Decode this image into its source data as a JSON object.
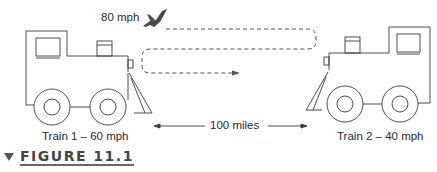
{
  "figure": {
    "caption_label": "FIGURE 11.1",
    "bird_label": "80 mph",
    "distance_label": "100 miles",
    "train1": {
      "label": "Train 1 – 60 mph",
      "speed_mph": 60
    },
    "train2": {
      "label": "Train 2 – 40 mph",
      "speed_mph": 40
    },
    "bird": {
      "icon": "bird-icon",
      "speed_mph": 80
    },
    "distance_miles": 100
  },
  "colors": {
    "line": "#3a3a3a",
    "dashed": "#555555",
    "bird": "#4a4a4a",
    "caption": "#444444"
  }
}
